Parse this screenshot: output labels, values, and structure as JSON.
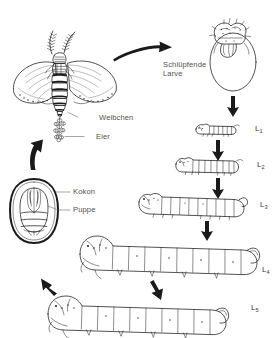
{
  "diagram": {
    "background_color": "#ffffff",
    "ink_color": "#1a1a1a",
    "label_color": "#55514f"
  },
  "labels": {
    "weibchen": "Weibchen",
    "eier": "Eier",
    "kokon": "Kokon",
    "puppe": "Puppe",
    "schluepfende_larve_line1": "Schlüpfende",
    "schluepfende_larve_line2": "Larve"
  },
  "stages": [
    {
      "id": "L1",
      "letter": "L",
      "index": "1"
    },
    {
      "id": "L2",
      "letter": "L",
      "index": "2"
    },
    {
      "id": "L3",
      "letter": "L",
      "index": "3"
    },
    {
      "id": "L4",
      "letter": "L",
      "index": "4"
    },
    {
      "id": "L5",
      "letter": "L",
      "index": "5"
    }
  ],
  "figures": [
    {
      "name": "adult-moth-female",
      "label": "Weibchen"
    },
    {
      "name": "egg-cluster",
      "label": "Eier"
    },
    {
      "name": "egg-with-hatching-larva",
      "label": "Schlüpfende Larve"
    },
    {
      "name": "larva-instar-1",
      "label": "L1"
    },
    {
      "name": "larva-instar-2",
      "label": "L2"
    },
    {
      "name": "larva-instar-3",
      "label": "L3"
    },
    {
      "name": "larva-instar-4",
      "label": "L4"
    },
    {
      "name": "larva-instar-5",
      "label": "L5"
    },
    {
      "name": "cocoon-with-pupa",
      "label": "Kokon / Puppe"
    }
  ],
  "arrows": [
    {
      "name": "arrow-moth-to-egg",
      "direction": "right"
    },
    {
      "name": "arrow-egg-to-l1",
      "direction": "down"
    },
    {
      "name": "arrow-l1-to-l2",
      "direction": "down"
    },
    {
      "name": "arrow-l2-to-l3",
      "direction": "down"
    },
    {
      "name": "arrow-l3-to-l4",
      "direction": "down"
    },
    {
      "name": "arrow-l4-to-l5",
      "direction": "down"
    },
    {
      "name": "arrow-l5-to-cocoon",
      "direction": "up-left"
    },
    {
      "name": "arrow-cocoon-to-moth",
      "direction": "up"
    }
  ]
}
